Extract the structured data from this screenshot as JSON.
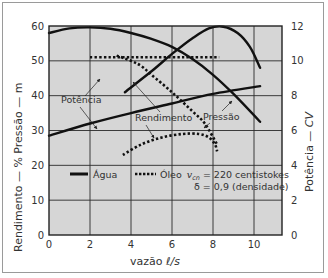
{
  "chart_data": {
    "type": "line",
    "title": "",
    "xlabel": "vazão ℓ/s",
    "ylabel_left": "Rendimento — %   Pressão — m",
    "ylabel_right": "Potência — CV",
    "xlim": [
      0,
      11.4
    ],
    "ylim_left": [
      0,
      60
    ],
    "ylim_right": [
      0,
      12
    ],
    "x_ticks": [
      "0",
      "2",
      "4",
      "6",
      "8",
      "10"
    ],
    "y_ticks_left": [
      "0",
      "10",
      "20",
      "30",
      "40",
      "50",
      "60"
    ],
    "y_ticks_right": [
      "0",
      "2",
      "4",
      "6",
      "8",
      "10",
      "12"
    ],
    "grid": true,
    "legend": {
      "position": "inside-bottom",
      "entries": [
        {
          "style": "solid",
          "label": "Água"
        },
        {
          "style": "dotted",
          "label": "Óleo",
          "extra_line1": "v_cn = 220 centistokes",
          "extra_line2": "δ = 0,9 (densidade)"
        }
      ]
    },
    "annotations": [
      "Potência",
      "Rendimento",
      "Pressão"
    ],
    "series": [
      {
        "name": "Pressão (Água)",
        "axis": "left",
        "unit": "m",
        "style": "solid",
        "x": [
          0,
          1,
          2,
          3,
          4,
          5,
          6,
          7,
          8,
          9,
          10.3
        ],
        "y": [
          58,
          59.3,
          59.6,
          59.2,
          58,
          56.3,
          54,
          50.5,
          46,
          40.5,
          32.5
        ]
      },
      {
        "name": "Rendimento (Água)",
        "axis": "left",
        "unit": "%",
        "style": "solid",
        "x": [
          3.7,
          5,
          6,
          7,
          7.8,
          8.5,
          9.2,
          9.8,
          10.3
        ],
        "y": [
          41,
          47,
          52,
          56.5,
          59.3,
          59.8,
          58,
          54,
          48
        ]
      },
      {
        "name": "Potência (Água)",
        "axis": "right",
        "unit": "CV",
        "style": "solid",
        "x": [
          0,
          2,
          4,
          6,
          8,
          10.3
        ],
        "y": [
          5.7,
          6.4,
          7.0,
          7.55,
          8.1,
          8.55
        ]
      },
      {
        "name": "Pressão (Óleo)",
        "axis": "left",
        "unit": "m",
        "style": "dotted",
        "x": [
          2,
          3,
          4,
          5,
          6,
          7,
          8.3
        ],
        "y": [
          51,
          51,
          51,
          51,
          51,
          51,
          51
        ]
      },
      {
        "name": "Rendimento (Óleo)",
        "axis": "left",
        "unit": "%",
        "style": "dotted",
        "x": [
          3.6,
          4.5,
          5.5,
          6.5,
          7.3,
          7.8,
          8.1,
          8.2
        ],
        "y": [
          23,
          26,
          28,
          29,
          29,
          28,
          26,
          24
        ]
      },
      {
        "name": "Potência (Óleo)",
        "axis": "right",
        "unit": "CV",
        "style": "dotted",
        "x": [
          3.3,
          4,
          4.5,
          5,
          6,
          7,
          7.6,
          8.2
        ],
        "y": [
          10.3,
          10.0,
          9.7,
          9.2,
          8.2,
          7.1,
          6.4,
          5.2
        ]
      }
    ]
  },
  "labels": {
    "ylabel_left": "Rendimento — %    Pressão — m",
    "ylabel_right_a": "Potência — ",
    "ylabel_right_b": "CV",
    "xlabel_a": "vazão  ",
    "xlabel_b": "ℓ/s",
    "ann_potencia": "Potência",
    "ann_rendimento": "Rendimento",
    "ann_pressao": "Pressão",
    "legend_agua": "Água",
    "legend_oleo": "Óleo",
    "legend_nu": "v",
    "legend_nu_sub": "cn",
    "legend_nu_rest": " = 220 centistokes",
    "legend_delta": "δ = 0,9 (densidade)"
  },
  "colors": {
    "plot_bg": "#d6d6d6",
    "grid": "#2a2a2a",
    "curve": "#111111",
    "frame": "#9a9a9a"
  }
}
